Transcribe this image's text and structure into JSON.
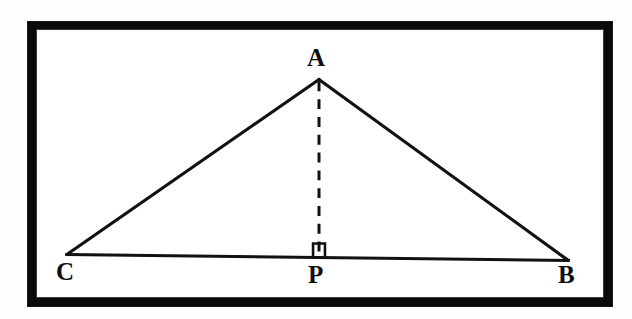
{
  "figure": {
    "kind": "euclidean-geometry-diagram",
    "background_color": "#ffffff",
    "frame_color": "#0a0a0a",
    "stroke_color": "#111111",
    "stroke_width": 3,
    "points": [
      {
        "id": "A",
        "label": "A",
        "x": 320,
        "y": 79,
        "role": "apex-vertex"
      },
      {
        "id": "C",
        "label": "C",
        "x": 66,
        "y": 256,
        "role": "base-vertex-left"
      },
      {
        "id": "B",
        "label": "B",
        "x": 571,
        "y": 262,
        "role": "base-vertex-right"
      },
      {
        "id": "P",
        "label": "P",
        "x": 320,
        "y": 259,
        "role": "foot-of-altitude"
      }
    ],
    "segments": [
      {
        "id": "AC",
        "from": "A",
        "to": "C",
        "style": "solid",
        "name": "side-ac"
      },
      {
        "id": "AB",
        "from": "A",
        "to": "B",
        "style": "solid",
        "name": "side-ab"
      },
      {
        "id": "CB",
        "from": "C",
        "to": "B",
        "style": "solid",
        "name": "base-cb"
      },
      {
        "id": "AP",
        "from": "A",
        "to": "P",
        "style": "dashed",
        "name": "altitude-ap"
      }
    ],
    "markers": [
      {
        "id": "right-angle-P",
        "type": "right-angle-square",
        "at": "P",
        "x": 314,
        "y": 245,
        "size": 11,
        "name": "right-angle-marker"
      }
    ],
    "dash": {
      "length": 10,
      "gap": 8
    }
  },
  "labels": {
    "A": "A",
    "B": "B",
    "C": "C",
    "P": "P"
  }
}
